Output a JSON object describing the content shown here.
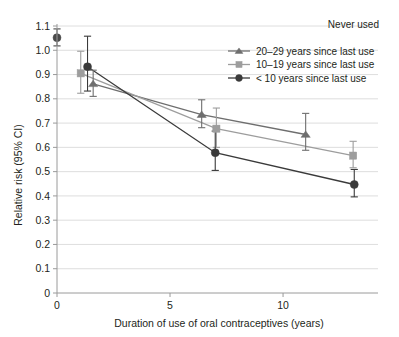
{
  "chart_data": {
    "type": "line",
    "title": "",
    "subtitle": "",
    "xlabel": "Duration of use of oral contraceptives (years)",
    "ylabel": "Relative risk (95% CI)",
    "xlim": [
      0,
      14.2
    ],
    "ylim": [
      0,
      1.1
    ],
    "xticks": [
      0,
      5,
      10
    ],
    "xtick_labels": [
      "0",
      "5",
      "10"
    ],
    "yticks": [
      0,
      0.1,
      0.2,
      0.3,
      0.4,
      0.5,
      0.6,
      0.7,
      0.8,
      0.9,
      1.0,
      1.1
    ],
    "ytick_labels": [
      "0",
      "0.1",
      "0.2",
      "0.3",
      "0.4",
      "0.5",
      "0.6",
      "0.7",
      "0.8",
      "0.9",
      "1.0",
      "1.1"
    ],
    "grid": true,
    "grid_axis": "y",
    "legend_position": "top-right",
    "annotations": [
      {
        "name": "never-used-label",
        "text": "Never used",
        "x": 13.9,
        "y": 1.08,
        "anchor": "end"
      }
    ],
    "reference_point": {
      "name": "never-used-point",
      "label": "Never used",
      "x": 0.0,
      "y": 1.052,
      "ci_low": 1.018,
      "ci_high": 1.088,
      "marker": "circle",
      "color": "#4a4a4a"
    },
    "series": [
      {
        "name": "20–29 years since last use",
        "marker": "triangle",
        "color": "#6e6e6e",
        "points": [
          {
            "x": 1.6,
            "y": 0.862,
            "ci_low": 0.81,
            "ci_high": 0.918
          },
          {
            "x": 6.4,
            "y": 0.735,
            "ci_low": 0.681,
            "ci_high": 0.796
          },
          {
            "x": 11.0,
            "y": 0.653,
            "ci_low": 0.588,
            "ci_high": 0.74
          }
        ]
      },
      {
        "name": "10–19 years since last use",
        "marker": "square",
        "color": "#9d9d9d",
        "points": [
          {
            "x": 1.05,
            "y": 0.905,
            "ci_low": 0.823,
            "ci_high": 0.996
          },
          {
            "x": 7.05,
            "y": 0.677,
            "ci_low": 0.6,
            "ci_high": 0.762
          },
          {
            "x": 13.1,
            "y": 0.566,
            "ci_low": 0.516,
            "ci_high": 0.625
          }
        ]
      },
      {
        "name": "< 10 years since last use",
        "marker": "circle",
        "color": "#3a3a3a",
        "points": [
          {
            "x": 1.35,
            "y": 0.932,
            "ci_low": 0.832,
            "ci_high": 1.058
          },
          {
            "x": 7.0,
            "y": 0.578,
            "ci_low": 0.505,
            "ci_high": 0.667
          },
          {
            "x": 13.15,
            "y": 0.447,
            "ci_low": 0.396,
            "ci_high": 0.509
          }
        ]
      }
    ]
  },
  "legend": {
    "items": [
      {
        "label": "20–29 years since last use",
        "marker": "triangle",
        "color": "#6e6e6e"
      },
      {
        "label": "10–19 years since last use",
        "marker": "square",
        "color": "#9d9d9d"
      },
      {
        "label": "< 10 years since last use",
        "marker": "circle",
        "color": "#3a3a3a"
      }
    ]
  },
  "colors": {
    "grid": "#d6d6d6",
    "axis": "#9a9a9a",
    "text": "#231f20",
    "background": "#ffffff",
    "series_20_29": "#6e6e6e",
    "series_10_19": "#9d9d9d",
    "series_lt_10": "#3a3a3a"
  }
}
